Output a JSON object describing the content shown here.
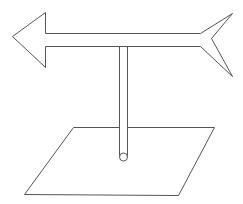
{
  "diagram": {
    "description": "Line drawing of a weather vane: a horizontal arrow on a vertical pole standing on a flat parallelogram base",
    "colors": {
      "background": "#ffffff",
      "stroke": "#555555"
    },
    "parts": [
      {
        "name": "arrow",
        "direction": "left"
      },
      {
        "name": "pole",
        "orientation": "vertical"
      },
      {
        "name": "base-plane",
        "shape": "parallelogram"
      },
      {
        "name": "pole-end",
        "shape": "circle"
      }
    ]
  }
}
